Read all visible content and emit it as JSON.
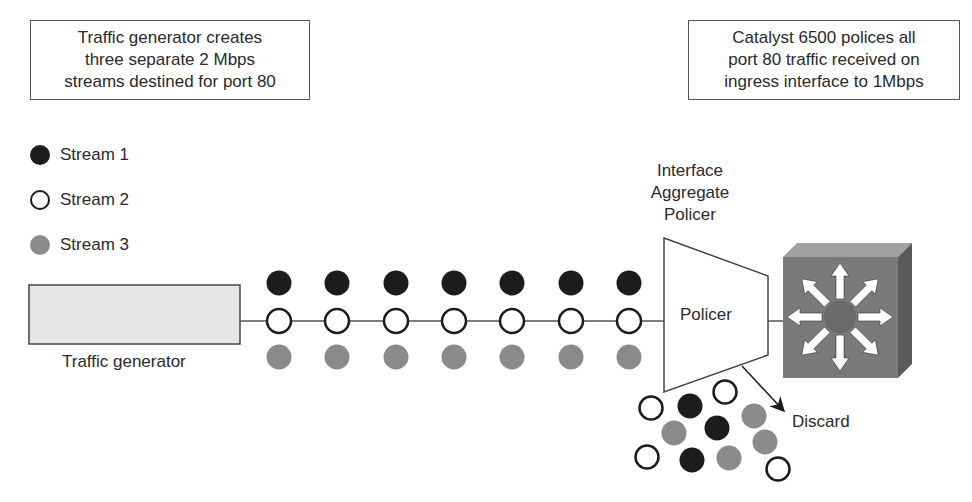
{
  "top_left_note": {
    "lines": [
      "Traffic generator creates",
      "three separate 2 Mbps",
      "streams destined for port 80"
    ]
  },
  "top_right_note": {
    "lines": [
      "Catalyst 6500 polices all",
      "port 80 traffic received on",
      "ingress interface to 1Mbps"
    ]
  },
  "legend": {
    "items": [
      {
        "label": "Stream 1",
        "style": "black",
        "color": "#1c1c1c"
      },
      {
        "label": "Stream 2",
        "style": "white",
        "color": "#ffffff"
      },
      {
        "label": "Stream 3",
        "style": "gray",
        "color": "#8a8a8a"
      }
    ]
  },
  "traffic_generator": {
    "label": "Traffic generator",
    "fill_color": "#e6e6e6"
  },
  "stream_packets": {
    "columns": 7,
    "rows": [
      "Stream 1",
      "Stream 2",
      "Stream 3"
    ]
  },
  "policer": {
    "title_lines": [
      "Interface",
      "Aggregate",
      "Policer"
    ],
    "label": "Policer"
  },
  "switch": {
    "name": "Catalyst 6500",
    "icon": "layer3-switch-icon",
    "color": "#777777"
  },
  "discard": {
    "label": "Discard",
    "packets": [
      "Stream 2",
      "Stream 1",
      "Stream 2",
      "Stream 3",
      "Stream 1",
      "Stream 3",
      "Stream 2",
      "Stream 1",
      "Stream 3",
      "Stream 3",
      "Stream 2"
    ]
  }
}
